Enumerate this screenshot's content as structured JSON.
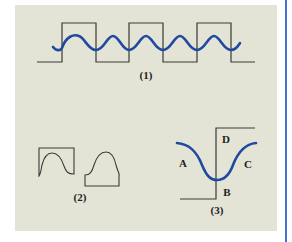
{
  "figure": {
    "background": "#e4e4d6",
    "accent_rule_color": "#4a6fd4",
    "curve_color": "#1f4aa0",
    "line_color": "#3a3a3a",
    "panels": [
      {
        "id": "1",
        "label": "(1)",
        "description": "square wave with superimposed sine wave"
      },
      {
        "id": "2",
        "label": "(2)",
        "description": "two profile shapes: a concave cutout block and a raised bump block"
      },
      {
        "id": "3",
        "label": "(3)",
        "description": "single step with curve through trough",
        "region_labels": {
          "A": "A",
          "B": "B",
          "C": "C",
          "D": "D"
        }
      }
    ]
  }
}
